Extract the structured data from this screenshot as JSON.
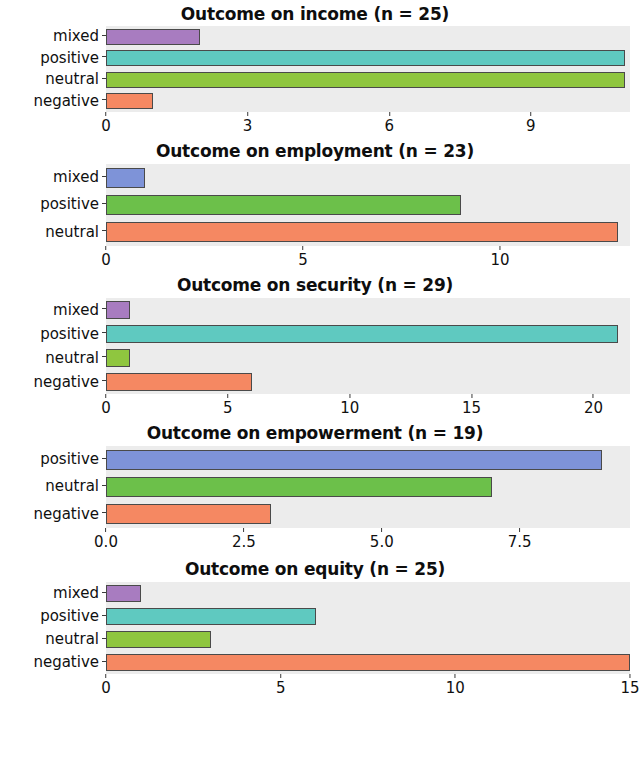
{
  "figure": {
    "background": "#ffffff",
    "panel_background": "#ececec",
    "bar_border_color": "#4a4a4a"
  },
  "palette": {
    "mixed_purple": "#a87cc0",
    "positive_teal": "#5fc9c0",
    "neutral_yellowgreen": "#8fc63f",
    "negative_salmon": "#f58862",
    "mixed_blue": "#7e93d8",
    "positive_green": "#6cc04a",
    "positive_blue": "#7e93d8",
    "neutral_green": "#6cc04a"
  },
  "chart_data": [
    {
      "type": "bar",
      "orientation": "horizontal",
      "title": "Outcome on income (n = 25)",
      "n": 25,
      "xlabel": "",
      "ylabel": "",
      "categories": [
        "mixed",
        "positive",
        "neutral",
        "negative"
      ],
      "values": [
        2,
        11,
        11,
        1
      ],
      "colors": [
        "#a87cc0",
        "#5fc9c0",
        "#8fc63f",
        "#f58862"
      ],
      "xticks": [
        0,
        3,
        6,
        9
      ],
      "xtick_labels": [
        "0",
        "3",
        "6",
        "9"
      ],
      "xlim": [
        0,
        11.1
      ],
      "grid": false,
      "legend": "none"
    },
    {
      "type": "bar",
      "orientation": "horizontal",
      "title": "Outcome on employment (n = 23)",
      "n": 23,
      "xlabel": "",
      "ylabel": "",
      "categories": [
        "mixed",
        "positive",
        "neutral"
      ],
      "values": [
        1,
        9,
        13
      ],
      "colors": [
        "#7e93d8",
        "#6cc04a",
        "#f58862"
      ],
      "xticks": [
        0,
        5,
        10
      ],
      "xtick_labels": [
        "0",
        "5",
        "10"
      ],
      "xlim": [
        0,
        13.3
      ],
      "grid": false,
      "legend": "none"
    },
    {
      "type": "bar",
      "orientation": "horizontal",
      "title": "Outcome on security (n = 29)",
      "n": 29,
      "xlabel": "",
      "ylabel": "",
      "categories": [
        "mixed",
        "positive",
        "neutral",
        "negative"
      ],
      "values": [
        1,
        21,
        1,
        6
      ],
      "colors": [
        "#a87cc0",
        "#5fc9c0",
        "#8fc63f",
        "#f58862"
      ],
      "xticks": [
        0,
        5,
        10,
        15,
        20
      ],
      "xtick_labels": [
        "0",
        "5",
        "10",
        "15",
        "20"
      ],
      "xlim": [
        0,
        21.5
      ],
      "grid": false,
      "legend": "none"
    },
    {
      "type": "bar",
      "orientation": "horizontal",
      "title": "Outcome on empowerment (n = 19)",
      "n": 19,
      "xlabel": "",
      "ylabel": "",
      "categories": [
        "positive",
        "neutral",
        "negative"
      ],
      "values": [
        9,
        7,
        3
      ],
      "colors": [
        "#7e93d8",
        "#6cc04a",
        "#f58862"
      ],
      "xticks": [
        0.0,
        2.5,
        5.0,
        7.5
      ],
      "xtick_labels": [
        "0.0",
        "2.5",
        "5.0",
        "7.5"
      ],
      "xlim": [
        0,
        9.5
      ],
      "grid": false,
      "legend": "none"
    },
    {
      "type": "bar",
      "orientation": "horizontal",
      "title": "Outcome on equity (n = 25)",
      "n": 25,
      "xlabel": "",
      "ylabel": "",
      "categories": [
        "mixed",
        "positive",
        "neutral",
        "negative"
      ],
      "values": [
        1,
        6,
        3,
        15
      ],
      "colors": [
        "#a87cc0",
        "#5fc9c0",
        "#8fc63f",
        "#f58862"
      ],
      "xticks": [
        0,
        5,
        10,
        15
      ],
      "xtick_labels": [
        "0",
        "5",
        "10",
        "15"
      ],
      "xlim": [
        0,
        15
      ],
      "grid": false,
      "legend": "none"
    }
  ],
  "layout": {
    "panels": [
      {
        "title_top": 2,
        "title_height": 24,
        "panel_height": 86,
        "axis_height": 26
      },
      {
        "title_top": 0,
        "title_height": 26,
        "panel_height": 82,
        "axis_height": 26
      },
      {
        "title_top": 0,
        "title_height": 26,
        "panel_height": 96,
        "axis_height": 26
      },
      {
        "title_top": 0,
        "title_height": 26,
        "panel_height": 82,
        "axis_height": 28
      },
      {
        "title_top": 0,
        "title_height": 26,
        "panel_height": 92,
        "axis_height": 24
      }
    ]
  }
}
